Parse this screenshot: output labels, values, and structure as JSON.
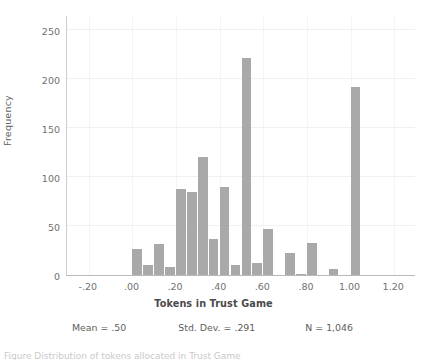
{
  "chart_data": {
    "type": "bar",
    "title": "",
    "xlabel": "Tokens in Trust Game",
    "ylabel": "Frequency",
    "xlim": [
      -0.3,
      1.3
    ],
    "ylim": [
      0,
      265
    ],
    "grid": true,
    "legend_position": "none",
    "bin_width": 0.05,
    "x_tick_labels": [
      "-.20",
      ".00",
      ".20",
      ".40",
      ".60",
      ".80",
      "1.00",
      "1.20"
    ],
    "x_tick_values": [
      -0.2,
      0.0,
      0.2,
      0.4,
      0.6,
      0.8,
      1.0,
      1.2
    ],
    "y_tick_labels": [
      "0",
      "50",
      "100",
      "150",
      "200",
      "250"
    ],
    "y_tick_values": [
      0,
      50,
      100,
      150,
      200,
      250
    ],
    "bin_starts": [
      0.0,
      0.05,
      0.1,
      0.15,
      0.2,
      0.25,
      0.3,
      0.35,
      0.4,
      0.45,
      0.5,
      0.55,
      0.6,
      0.65,
      0.7,
      0.75,
      0.8,
      0.85,
      0.9,
      0.95,
      1.0
    ],
    "values": [
      27,
      10,
      32,
      8,
      88,
      85,
      120,
      37,
      90,
      10,
      221,
      12,
      47,
      0,
      22,
      1,
      33,
      0,
      6,
      0,
      192
    ],
    "bar_color": "#a9a9a9",
    "annotations": {
      "mean": "Mean = .50",
      "std_dev": "Std. Dev. = .291",
      "n": "N = 1,046"
    }
  },
  "caption": {
    "clipped_text": "Figure    Distribution of tokens allocated in Trust Game"
  }
}
